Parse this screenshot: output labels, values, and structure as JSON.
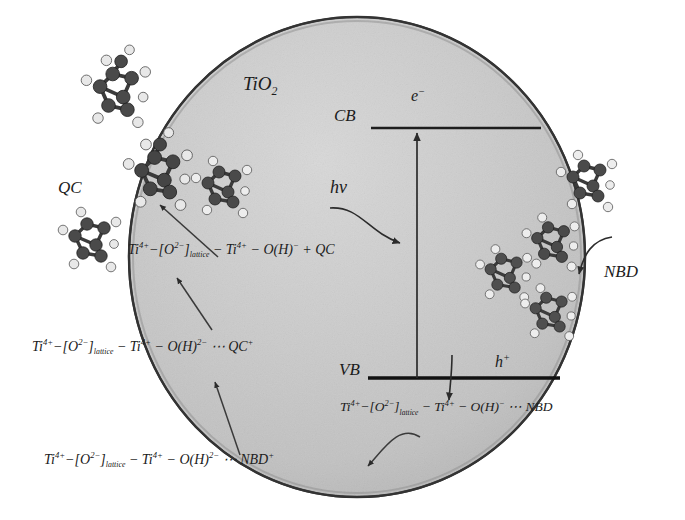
{
  "diagram": {
    "title_label": "TiO2",
    "particle": {
      "name": "TiO2 semiconductor particle",
      "label": "TiO",
      "label_sub": "2",
      "fill_color": "#c9c9c9",
      "edge_color": "#3a3a3a"
    },
    "bands": {
      "conduction": {
        "label": "CB",
        "carrier": "e",
        "carrier_charge": "−"
      },
      "valence": {
        "label": "VB",
        "carrier": "h",
        "carrier_charge": "+"
      },
      "excitation": {
        "label": "hv"
      }
    },
    "species": {
      "quadricyclane": "QC",
      "norbornadiene": "NBD"
    },
    "equations": [
      {
        "id": "eq-qc-product",
        "text": "Ti 4+ −[O 2− ]lattice − Ti 4+ − O(H) − + QC",
        "parts": [
          {
            "t": "Ti"
          },
          {
            "sup": "4+"
          },
          {
            "t": "−["
          },
          {
            "t": "O"
          },
          {
            "sup": "2−"
          },
          {
            "t": "]"
          },
          {
            "sub": "lattice"
          },
          {
            "t": " − Ti"
          },
          {
            "sup": "4+"
          },
          {
            "t": " − O(H)"
          },
          {
            "sup": "−"
          },
          {
            "t": " + QC"
          }
        ]
      },
      {
        "id": "eq-qc-cation",
        "text": "Ti 4+ −[O 2− ]lattice − Ti 4+ − O(H) 2− ⋯ QC +",
        "parts": [
          {
            "t": "Ti"
          },
          {
            "sup": "4+"
          },
          {
            "t": "−["
          },
          {
            "t": "O"
          },
          {
            "sup": "2−"
          },
          {
            "t": "]"
          },
          {
            "sub": "lattice"
          },
          {
            "t": " − Ti"
          },
          {
            "sup": "4+"
          },
          {
            "t": " − O(H)"
          },
          {
            "sup": "2−"
          },
          {
            "t": " ⋯ QC"
          },
          {
            "sup": "+"
          }
        ]
      },
      {
        "id": "eq-nbd-cation",
        "text": "Ti 4+ −[O 2− ]lattice − Ti 4+ − O(H) 2− ⋯ NBD +",
        "parts": [
          {
            "t": "Ti"
          },
          {
            "sup": "4+"
          },
          {
            "t": "−["
          },
          {
            "t": "O"
          },
          {
            "sup": "2−"
          },
          {
            "t": "]"
          },
          {
            "sub": "lattice"
          },
          {
            "t": " − Ti"
          },
          {
            "sup": "4+"
          },
          {
            "t": " − O(H)"
          },
          {
            "sup": "2−"
          },
          {
            "t": " ⋯ NBD"
          },
          {
            "sup": "+"
          }
        ]
      },
      {
        "id": "eq-nbd-adsorbed",
        "text": "Ti 4+ −[O 2− ]lattice − Ti 4+ − O(H) − ⋯ NBD",
        "parts": [
          {
            "t": "Ti"
          },
          {
            "sup": "4+"
          },
          {
            "t": "−["
          },
          {
            "t": "O"
          },
          {
            "sup": "2−"
          },
          {
            "t": "]"
          },
          {
            "sub": "lattice"
          },
          {
            "t": " − Ti"
          },
          {
            "sup": "4+"
          },
          {
            "t": " − O(H)"
          },
          {
            "sup": "−"
          },
          {
            "t": " ⋯ NBD"
          }
        ]
      }
    ]
  }
}
